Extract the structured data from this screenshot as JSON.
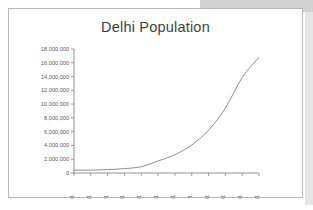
{
  "slide": {
    "background_color": "#ffffff",
    "band_color": "#d2d2d2",
    "frame_border_color": "#b7b7b7"
  },
  "chart_data": {
    "type": "line",
    "title": "Delhi Population",
    "xlabel": "",
    "ylabel": "",
    "grid": false,
    "legend": false,
    "line_color": "#7a7a7a",
    "axis_color": "#868686",
    "categories": [
      "1901",
      "1911",
      "1921",
      "1931",
      "1941",
      "1951",
      "1961",
      "1971",
      "1981",
      "1991",
      "2001",
      "2011"
    ],
    "x": [
      1901,
      1911,
      1921,
      1931,
      1941,
      1951,
      1961,
      1971,
      1981,
      1991,
      2001,
      2011
    ],
    "values": [
      405819,
      413851,
      488452,
      636246,
      917939,
      1744072,
      2658612,
      4065698,
      6220406,
      9420644,
      13850507,
      16787941
    ],
    "series": [
      {
        "name": "Delhi Population",
        "values": [
          405819,
          413851,
          488452,
          636246,
          917939,
          1744072,
          2658612,
          4065698,
          6220406,
          9420644,
          13850507,
          16787941
        ]
      }
    ],
    "ylim": [
      0,
      18000000
    ],
    "ytick_values": [
      0,
      2000000,
      4000000,
      6000000,
      8000000,
      10000000,
      12000000,
      14000000,
      16000000,
      18000000
    ],
    "ytick_labels": [
      "0",
      "2,000,000",
      "4,000,000",
      "6,000,000",
      "8,000,000",
      "10,000,000",
      "12,000,000",
      "14,000,000",
      "16,000,000",
      "18,000,000"
    ],
    "xtick_labels": [
      "1901",
      "1911",
      "1921",
      "1931",
      "1941",
      "1951",
      "1961",
      "1971",
      "1981",
      "1991",
      "2001",
      "2011"
    ],
    "xlabel_rotation": -90
  }
}
